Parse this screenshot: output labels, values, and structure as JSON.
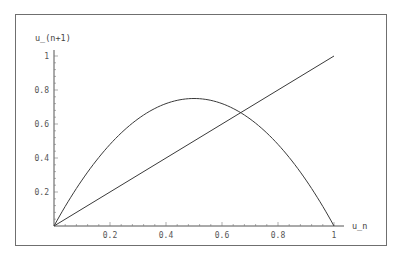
{
  "chart_data": {
    "type": "line",
    "title": "",
    "xlabel": "u_n",
    "ylabel": "u_(n+1)",
    "xlim": [
      0,
      1
    ],
    "ylim": [
      0,
      1
    ],
    "grid": false,
    "legend": null,
    "x_ticks": [
      "0.2",
      "0.4",
      "0.6",
      "0.8",
      "1"
    ],
    "y_ticks": [
      "0.2",
      "0.4",
      "0.6",
      "0.8",
      "1"
    ],
    "series": [
      {
        "name": "3 u_n (1 - u_n)",
        "x": [
          0,
          0.1,
          0.2,
          0.3,
          0.4,
          0.5,
          0.6,
          0.7,
          0.8,
          0.9,
          1.0
        ],
        "values": [
          0,
          0.27,
          0.48,
          0.63,
          0.72,
          0.75,
          0.72,
          0.63,
          0.48,
          0.27,
          0
        ]
      },
      {
        "name": "u_(n+1) = u_n",
        "x": [
          0,
          1
        ],
        "values": [
          0,
          1
        ]
      }
    ],
    "annotations": [
      {
        "type": "intersection",
        "x": 0.667,
        "y": 0.667
      }
    ],
    "colors": {
      "curve": "#3a3a3a",
      "line": "#3a3a3a",
      "axes": "#555555",
      "frame": "#6f6f6f"
    }
  },
  "labels": {
    "xlabel": "u_n",
    "ylabel": "u_(n+1)",
    "xticks": [
      "0.2",
      "0.4",
      "0.6",
      "0.8",
      "1"
    ],
    "yticks": [
      "0.2",
      "0.4",
      "0.6",
      "0.8",
      "1"
    ]
  }
}
